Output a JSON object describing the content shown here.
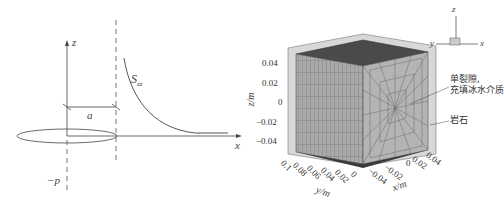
{
  "left_panel": {
    "labels": {
      "z_axis": "z",
      "x_axis": "x",
      "curve": "S",
      "curve_sub": "zz",
      "dimension": "a",
      "pressure": "−p"
    }
  },
  "right_panel": {
    "z_axis_label": "z/m",
    "y_axis_label": "y/m",
    "x_axis_label": "x/m",
    "z_ticks": [
      "0.04",
      "0.02",
      "0",
      "−0.02",
      "−0.04"
    ],
    "y_ticks": [
      "0.1",
      "0.08",
      "0.06",
      "0.04",
      "0.02",
      "0"
    ],
    "x_ticks": [
      "−0.04",
      "−0.02",
      "0",
      "0.02",
      "0.04"
    ],
    "orientation_triad": {
      "z": "z",
      "y": "y",
      "x": "x"
    },
    "annotations": {
      "fracture_line1": "单裂隙,",
      "fracture_line2": "充填冰水介质",
      "rock": "岩石"
    }
  }
}
